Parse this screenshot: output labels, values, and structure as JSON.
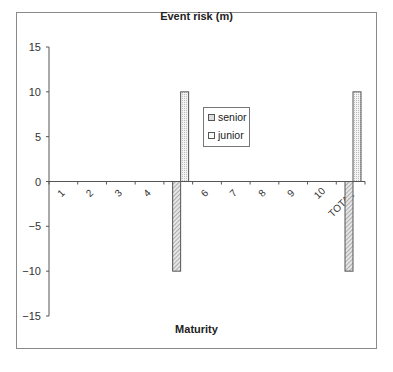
{
  "chart_data": {
    "type": "bar",
    "title": "Event risk (m)",
    "xlabel": "Maturity",
    "ylabel": "",
    "categories": [
      "1",
      "2",
      "3",
      "4",
      "5",
      "6",
      "7",
      "8",
      "9",
      "10",
      "TOTAL"
    ],
    "series": [
      {
        "name": "senior",
        "values": [
          0,
          0,
          0,
          0,
          -10,
          0,
          0,
          0,
          0,
          0,
          -10
        ],
        "pattern": "diagonal-hatch"
      },
      {
        "name": "junior",
        "values": [
          0,
          0,
          0,
          0,
          10,
          0,
          0,
          0,
          0,
          0,
          10
        ],
        "pattern": "dotted"
      }
    ],
    "ylim": [
      -15,
      15
    ],
    "yticks": [
      15,
      10,
      5,
      0,
      -5,
      -10,
      -15
    ],
    "ytick_labels": [
      "15",
      "10",
      "5",
      "0",
      "−5",
      "−10",
      "−15"
    ],
    "grid": false,
    "legend_position": "inside-center"
  },
  "legend": {
    "senior": "senior",
    "junior": "junior"
  }
}
